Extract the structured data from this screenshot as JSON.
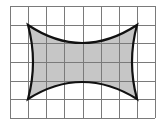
{
  "figure": {
    "grid": {
      "columns": 8,
      "rows": 6,
      "origin_x": 10,
      "origin_y": 6,
      "cell_width": 18.125,
      "cell_height": 18.67,
      "line_color": "#7a7a7a",
      "background_color": "#ffffff"
    },
    "shape": {
      "corners": {
        "top_left": [
          1,
          1
        ],
        "top_right": [
          7,
          1
        ],
        "bottom_right": [
          7,
          5
        ],
        "bottom_left": [
          1,
          5
        ]
      },
      "sides": "concave quadratic curves",
      "fill_color": "#c6c6c6",
      "stroke_color": "#111111",
      "stroke_width": 2.2
    }
  }
}
